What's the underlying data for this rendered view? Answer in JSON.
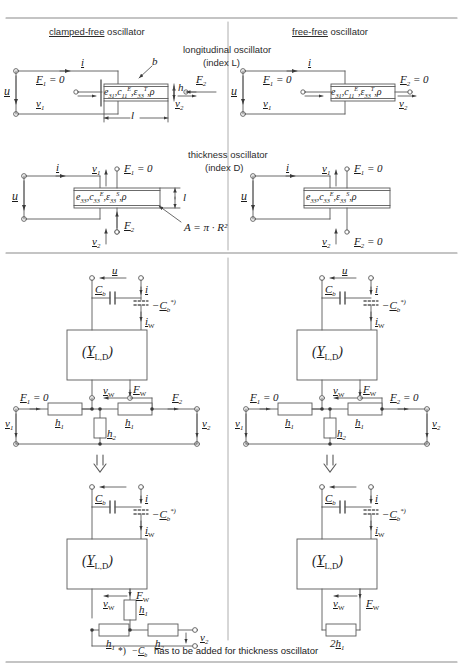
{
  "figure": {
    "headers": {
      "left": {
        "underlined": "clamped-free",
        "rest": " oscillator"
      },
      "right": {
        "underlined": "free-free",
        "rest": " oscillator"
      },
      "mode_long_1": "longitudinal oscillator",
      "mode_long_2": "(index L)",
      "mode_thick_1": "thickness oscillator",
      "mode_thick_2": "(index D)"
    },
    "footnote": "*)  −C_b  has to be added for thickness oscillator",
    "footnote_parts": {
      "mark": "*)",
      "symbol": "−C",
      "sub": "b",
      "text": "has to be added for thickness oscillator"
    }
  },
  "blocks": {
    "long_material": "e₃₁ , c₁₁ᴱ , ε₃₃ᵀ , ρ",
    "thick_material": "e₃₃ , c₃₃ᴱ , ε₃₃ˢ , ρ",
    "admittance": "(Y L,D )",
    "area": "A = π · R²"
  },
  "labels": {
    "current": "i",
    "voltage": "u",
    "v1": "v₁",
    "v2": "v₂",
    "F1_zero": "F₁ = 0",
    "F2": "F₂",
    "F2_zero": "F₂ = 0",
    "F1": "F₁",
    "b": "b",
    "h": "h",
    "l": "l",
    "len_l": "l",
    "Cb": "Cb",
    "negCb": "−Cb",
    "iW": "iᴡ",
    "vW": "vᴡ",
    "FW": "Fᴡ",
    "h1": "h₁",
    "h2": "h₂",
    "twoh1": "2h₁",
    "star": "*)",
    "arrow_down": "⇓"
  },
  "colors": {
    "line": "#5a5a5a",
    "rule": "#8a8a8a",
    "text": "#1a1a1a",
    "fill": "#ffffff",
    "shade": "#d9d9d9"
  }
}
